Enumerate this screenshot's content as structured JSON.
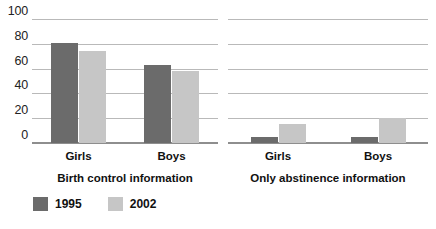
{
  "chart_data": {
    "type": "bar",
    "title": "",
    "xlabel": "",
    "ylabel": "",
    "ylim": [
      0,
      100
    ],
    "yticks": [
      100,
      80,
      60,
      40,
      20,
      0
    ],
    "grid": true,
    "legend_position": "bottom-left",
    "legend": [
      {
        "name": "1995",
        "color": "#6b6b6b"
      },
      {
        "name": "2002",
        "color": "#c6c6c6"
      }
    ],
    "panels": [
      {
        "title": "Birth control information",
        "categories": [
          "Girls",
          "Boys"
        ],
        "series": [
          {
            "name": "1995",
            "color": "#6b6b6b",
            "values": [
              81,
              63
            ]
          },
          {
            "name": "2002",
            "color": "#c6c6c6",
            "values": [
              74,
              58
            ]
          }
        ]
      },
      {
        "title": "Only abstinence information",
        "categories": [
          "Girls",
          "Boys"
        ],
        "series": [
          {
            "name": "1995",
            "color": "#6b6b6b",
            "values": [
              5,
              5
            ]
          },
          {
            "name": "2002",
            "color": "#c6c6c6",
            "values": [
              15,
              20
            ]
          }
        ]
      }
    ]
  }
}
